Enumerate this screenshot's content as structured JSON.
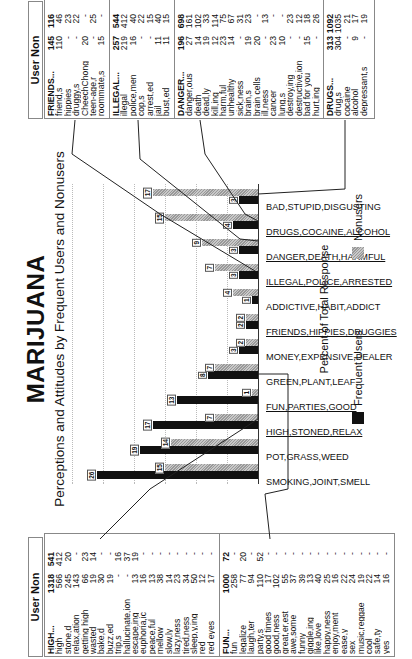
{
  "chart_data": {
    "type": "bar",
    "orientation": "vertical-bars, page rotated 90deg",
    "title": "MARIJUANA",
    "subtitle": "Perceptions and Attitudes by Frequent Users and Nonusers",
    "xlabel": "",
    "ylabel": "Percent of Total Response",
    "ylim": [
      0,
      30
    ],
    "yticks": [
      0,
      5,
      10,
      15,
      20,
      25,
      30
    ],
    "grid": true,
    "legend_position": "bottom",
    "categories": [
      "SMOKING,JOINT,SMELL",
      "POT,GRASS,WEED",
      "HIGH,STONED,RELAX",
      "FUN,PARTIES,GOOD",
      "GREEN,PLANT,LEAF",
      "MONEY,EXPENSIVE,DEALER",
      "FRIENDS,HIPPIES,DRUGGIES",
      "ADDICTIVE,HABIT,ADDICT",
      "ILLEGAL,POLICE,ARRESTED",
      "DANGER,DEATH,HARMFUL",
      "DRUGS,COCAINE,ALCOHOL",
      "BAD,STUPID,DISGUSTING"
    ],
    "series": [
      {
        "name": "Frequent Users",
        "color": "#111111",
        "values": [
          26,
          19,
          17,
          13,
          8,
          3,
          2,
          1,
          3,
          3,
          4,
          3
        ]
      },
      {
        "name": "Nonusers",
        "color": "#aaaaaa",
        "values": [
          15,
          14,
          7,
          1,
          7,
          2,
          2,
          4,
          7,
          9,
          15,
          17
        ]
      }
    ]
  },
  "header": {
    "title": "MARIJUANA",
    "subtitle": "Perceptions and Attitudes by Frequent Users and Nonusers"
  },
  "axis": {
    "label": "Percent of Total Response",
    "ticks": [
      "0",
      "5",
      "10",
      "15",
      "20",
      "25",
      "30"
    ]
  },
  "legend": {
    "users": "Frequent Users",
    "nonusers": "Nonusers"
  },
  "tables": {
    "left_header": "User Non",
    "right_header": "User Non",
    "high": [
      [
        "HIGH...",
        "1318",
        "541"
      ],
      [
        "high",
        "566",
        "412"
      ],
      [
        "stone,d",
        "245",
        "20"
      ],
      [
        "relax,ation",
        "143",
        "-"
      ],
      [
        "getting high",
        "66",
        "23"
      ],
      [
        "wasted",
        "19",
        "14"
      ],
      [
        "bake,d",
        "30",
        "-"
      ],
      [
        "buzz,ed",
        "19",
        "-"
      ],
      [
        "trip,s",
        "-",
        "16"
      ],
      [
        "hallucinate,ion",
        "-",
        "37"
      ],
      [
        "escape,ing",
        "13",
        "19"
      ],
      [
        "euphoria,ic",
        "16",
        "-"
      ],
      [
        "peace,ful",
        "13",
        "-"
      ],
      [
        "mellow",
        "38",
        "-"
      ],
      [
        "slow,ly",
        "14",
        "-"
      ],
      [
        "lazy,ness",
        "23",
        "-"
      ],
      [
        "tired,ness",
        "34",
        "-"
      ],
      [
        "sleep,y,ing",
        "50",
        "-"
      ],
      [
        "red",
        "12",
        "-"
      ],
      [
        "red eyes",
        "17",
        "-"
      ]
    ],
    "fun": [
      [
        "FUN...",
        "1000",
        "72"
      ],
      [
        "fun",
        "258",
        "-"
      ],
      [
        "legalize",
        "77",
        "20"
      ],
      [
        "laugh,ter",
        "94",
        "-"
      ],
      [
        "party,s",
        "110",
        "52"
      ],
      [
        "good times",
        "17",
        "-"
      ],
      [
        "good,ness",
        "102",
        "-"
      ],
      [
        "great,er,est",
        "55",
        "-"
      ],
      [
        "awe,some",
        "37",
        "-"
      ],
      [
        "funny",
        "39",
        "-"
      ],
      [
        "giggle,ing",
        "13",
        "-"
      ],
      [
        "like,love",
        "40",
        "-"
      ],
      [
        "happy,ness",
        "25",
        "-"
      ],
      [
        "enjoy,ment",
        "16",
        "-"
      ],
      [
        "ease,y",
        "22",
        "-"
      ],
      [
        "sex",
        "24",
        "-"
      ],
      [
        "music,reggae",
        "19",
        "-"
      ],
      [
        "cool",
        "22",
        "-"
      ],
      [
        "safe,ty",
        "14",
        "-"
      ],
      [
        "yes",
        "16",
        "-"
      ]
    ],
    "friends": [
      [
        "FRIENDS...",
        "145",
        "116"
      ],
      [
        "friend,s",
        "110",
        "46"
      ],
      [
        "hippies",
        "-",
        "23"
      ],
      [
        "druggy,s",
        "-",
        "22"
      ],
      [
        "CheechChong",
        "20",
        "-"
      ],
      [
        "teen-age,r",
        "-",
        "25"
      ],
      [
        "roommate,s",
        "15",
        "-"
      ]
    ],
    "illegal": [
      [
        "ILLEGAL...",
        "257",
        "544"
      ],
      [
        "illegal",
        "219",
        "412"
      ],
      [
        "police,men",
        "16",
        "40"
      ],
      [
        "cop,s",
        "-",
        "22"
      ],
      [
        "arrest,ed",
        "-",
        "15"
      ],
      [
        "jail",
        "11",
        "40"
      ],
      [
        "bust,ed",
        "11",
        "15"
      ]
    ],
    "danger": [
      [
        "DANGER...",
        "196",
        "698"
      ],
      [
        "danger,ous",
        "27",
        "161"
      ],
      [
        "death",
        "14",
        "102"
      ],
      [
        "dead,ly",
        "19",
        "33"
      ],
      [
        "kill,ing",
        "12",
        "114"
      ],
      [
        "harm,ful",
        "23",
        "75"
      ],
      [
        "unhealthy",
        "14",
        "67"
      ],
      [
        "sick,ness",
        "-",
        "31"
      ],
      [
        "brain,s",
        "19",
        "23"
      ],
      [
        "brain cells",
        "20",
        "-"
      ],
      [
        "ill,ness",
        "-",
        "13"
      ],
      [
        "cancer",
        "23",
        "-"
      ],
      [
        "lung,s",
        "10",
        "-"
      ],
      [
        "destroy,ing",
        "-",
        "23"
      ],
      [
        "destructive,ion",
        "-",
        "12"
      ],
      [
        "bad for you",
        "15",
        "18"
      ],
      [
        "hurt,ing",
        "-",
        "26"
      ]
    ],
    "drugs": [
      [
        "DRUGS...",
        "313",
        "1092"
      ],
      [
        "drug,s",
        "304",
        "1035"
      ],
      [
        "cocaine",
        "-",
        "21"
      ],
      [
        "alcohol",
        "9",
        "17"
      ],
      [
        "depressant,s",
        "-",
        "19"
      ]
    ]
  }
}
